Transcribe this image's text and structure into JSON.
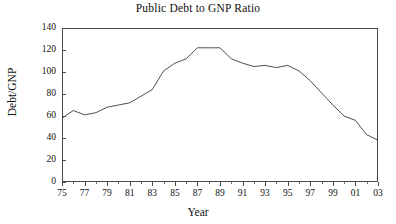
{
  "chart_data": {
    "type": "line",
    "title": "Public Debt to GNP Ratio",
    "xlabel": "Year",
    "ylabel": "Debt/GNP",
    "xlim": [
      1975,
      2003
    ],
    "ylim": [
      0,
      140
    ],
    "yticks": [
      0,
      20,
      40,
      60,
      80,
      100,
      120,
      140
    ],
    "ytick_labels": [
      "0",
      "20",
      "40",
      "60",
      "80",
      "100",
      "120",
      "140"
    ],
    "xticks": [
      1975,
      1977,
      1979,
      1981,
      1983,
      1985,
      1987,
      1989,
      1991,
      1993,
      1995,
      1997,
      1999,
      2001,
      2003
    ],
    "xtick_labels": [
      "75",
      "77",
      "79",
      "81",
      "83",
      "85",
      "87",
      "89",
      "91",
      "93",
      "95",
      "97",
      "99",
      "01",
      "03"
    ],
    "xminor_ticks": [
      1976,
      1978,
      1980,
      1982,
      1984,
      1986,
      1988,
      1990,
      1992,
      1994,
      1996,
      1998,
      2000,
      2002
    ],
    "grid": false,
    "legend": false,
    "line_color": "#3a3a3a",
    "x": [
      1975,
      1976,
      1977,
      1978,
      1979,
      1980,
      1981,
      1982,
      1983,
      1984,
      1985,
      1986,
      1987,
      1988,
      1989,
      1990,
      1991,
      1992,
      1993,
      1994,
      1995,
      1996,
      1997,
      1998,
      1999,
      2000,
      2001,
      2002,
      2003
    ],
    "values": [
      58,
      65,
      61,
      63,
      68,
      70,
      73,
      79,
      92,
      101,
      108,
      112,
      122,
      122,
      121,
      113,
      108,
      105,
      105,
      106,
      104,
      106,
      101,
      92,
      81,
      70,
      60,
      57,
      43
    ],
    "series": [
      {
        "name": "Debt/GNP",
        "points": [
          {
            "x": 1975,
            "y": 58
          },
          {
            "x": 1976,
            "y": 65
          },
          {
            "x": 1977,
            "y": 61
          },
          {
            "x": 1978,
            "y": 63
          },
          {
            "x": 1979,
            "y": 68
          },
          {
            "x": 1980,
            "y": 70
          },
          {
            "x": 1981,
            "y": 72
          },
          {
            "x": 1982,
            "y": 78
          },
          {
            "x": 1983,
            "y": 84
          },
          {
            "x": 1984,
            "y": 101
          },
          {
            "x": 1985,
            "y": 108
          },
          {
            "x": 1986,
            "y": 112
          },
          {
            "x": 1987,
            "y": 122
          },
          {
            "x": 1988,
            "y": 122
          },
          {
            "x": 1989,
            "y": 122
          },
          {
            "x": 1990,
            "y": 112
          },
          {
            "x": 1991,
            "y": 108
          },
          {
            "x": 1992,
            "y": 105
          },
          {
            "x": 1993,
            "y": 106
          },
          {
            "x": 1994,
            "y": 104
          },
          {
            "x": 1995,
            "y": 106
          },
          {
            "x": 1996,
            "y": 101
          },
          {
            "x": 1997,
            "y": 92
          },
          {
            "x": 1998,
            "y": 81
          },
          {
            "x": 1999,
            "y": 70
          },
          {
            "x": 2000,
            "y": 60
          },
          {
            "x": 2001,
            "y": 56
          },
          {
            "x": 2002,
            "y": 43
          },
          {
            "x": 2003,
            "y": 38
          }
        ]
      }
    ]
  }
}
